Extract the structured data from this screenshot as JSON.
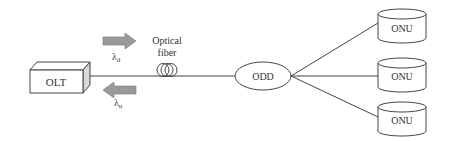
{
  "diagram": {
    "olt": {
      "label": "OLT"
    },
    "downstream": {
      "symbol": "λ",
      "subscript": "d"
    },
    "upstream": {
      "symbol": "λ",
      "subscript": "u"
    },
    "fiber": {
      "label_line1": "Optical",
      "label_line2": "fiber"
    },
    "odd": {
      "label": "ODD"
    },
    "onus": [
      {
        "label": "ONU"
      },
      {
        "label": "ONU"
      },
      {
        "label": "ONU"
      }
    ],
    "colors": {
      "stroke": "#444444",
      "arrow_fill": "#9a9a9a",
      "box_side": "#d8d8d8"
    }
  }
}
